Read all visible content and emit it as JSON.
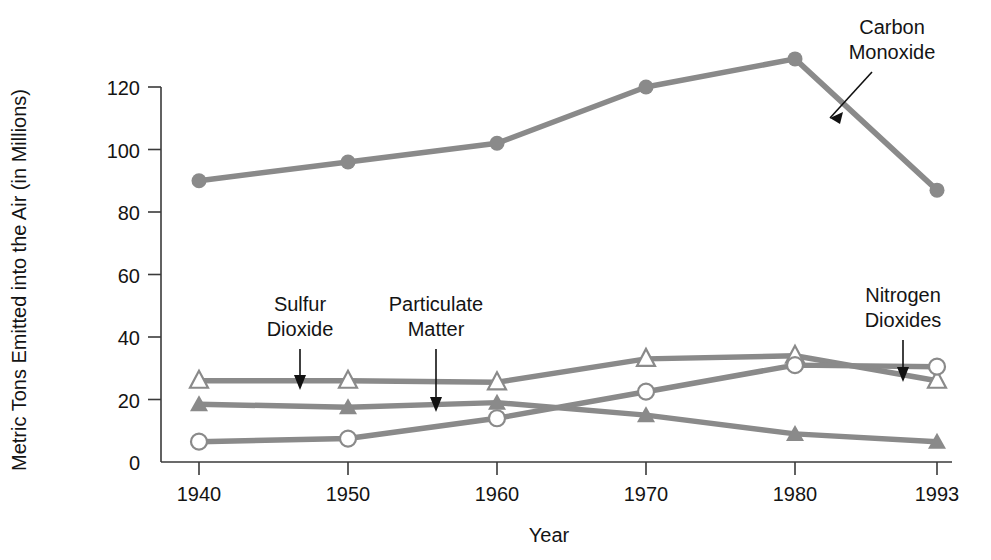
{
  "chart_data": {
    "type": "line",
    "title": "",
    "subtitle": "",
    "xlabel": "Year",
    "ylabel": "Metric Tons Emitted into the Air (in Millions)",
    "categories": [
      "1940",
      "1950",
      "1960",
      "1970",
      "1980",
      "1993"
    ],
    "x": [
      1940,
      1950,
      1960,
      1970,
      1980,
      1993
    ],
    "xtick_labels": [
      "1940",
      "1950",
      "1960",
      "1970",
      "1980",
      "1993"
    ],
    "ytick_labels": [
      "0",
      "20",
      "40",
      "60",
      "80",
      "100",
      "120"
    ],
    "yticks": [
      0,
      20,
      40,
      60,
      80,
      100,
      120
    ],
    "ylim": [
      0,
      130
    ],
    "grid": false,
    "legend": "none (direct annotations with arrows)",
    "series": [
      {
        "name": "Carbon Monoxide",
        "marker": "filled-circle",
        "color": "#8a8a8a",
        "values": [
          90,
          96,
          102,
          120,
          129,
          87
        ]
      },
      {
        "name": "Sulfur Dioxide",
        "marker": "open-triangle",
        "color": "#8a8a8a",
        "values": [
          26,
          26,
          25.5,
          33,
          34,
          26
        ]
      },
      {
        "name": "Particulate Matter",
        "marker": "filled-triangle",
        "color": "#8a8a8a",
        "values": [
          18.5,
          17.5,
          19,
          15,
          9,
          6.5
        ]
      },
      {
        "name": "Nitrogen Dioxides",
        "marker": "open-circle",
        "color": "#8a8a8a",
        "values": [
          6.5,
          7.5,
          14,
          22.5,
          31,
          30.5
        ]
      }
    ],
    "annotations": [
      {
        "label_line1": "Carbon",
        "label_line2": "Monoxide",
        "target_series": "Carbon Monoxide"
      },
      {
        "label_line1": "Sulfur",
        "label_line2": "Dioxide",
        "target_series": "Sulfur Dioxide"
      },
      {
        "label_line1": "Particulate",
        "label_line2": "Matter",
        "target_series": "Particulate Matter"
      },
      {
        "label_line1": "Nitrogen",
        "label_line2": "Dioxides",
        "target_series": "Nitrogen Dioxides"
      }
    ],
    "colors": {
      "series": "#8a8a8a",
      "axis": "#3a3a3a",
      "text": "#141414",
      "background": "#ffffff"
    }
  }
}
